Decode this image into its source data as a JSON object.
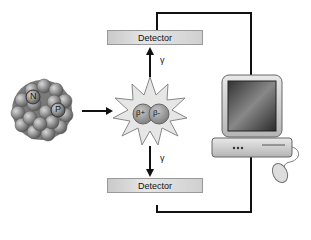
{
  "diagram": {
    "nucleus": {
      "labels": [
        "N",
        "P"
      ]
    },
    "annihilation": {
      "labels": [
        "β+",
        "β-"
      ]
    },
    "gamma_label": "γ",
    "detectors": [
      {
        "label": "Detector"
      },
      {
        "label": "Detector"
      }
    ],
    "computer": {
      "label": ""
    }
  }
}
